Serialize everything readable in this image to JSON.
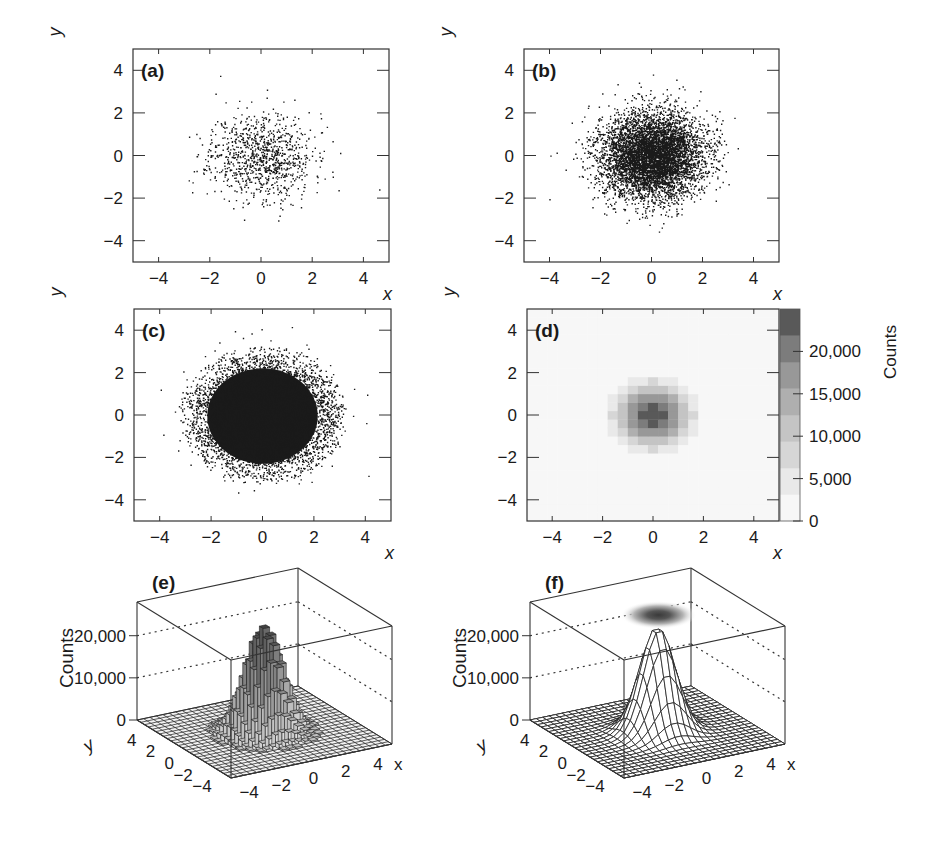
{
  "chart_data": [
    {
      "id": "a",
      "type": "scatter",
      "panel_label": "(a)",
      "title": "",
      "xlabel": "x",
      "ylabel": "y",
      "xlim": [
        -5,
        5
      ],
      "ylim": [
        -5,
        5
      ],
      "xticks": [
        -4,
        -2,
        0,
        2,
        4
      ],
      "yticks": [
        -4,
        -2,
        0,
        2,
        4
      ],
      "xtick_labels": [
        "−4",
        "−2",
        "0",
        "2",
        "4"
      ],
      "ytick_labels": [
        "−4",
        "−2",
        "0",
        "2",
        "4"
      ],
      "grid": false,
      "distribution": "2D Gaussian, mean (0,0), sigma 1",
      "approx_points": 1000,
      "marker_color": "#1a1a1a"
    },
    {
      "id": "b",
      "type": "scatter",
      "panel_label": "(b)",
      "title": "",
      "xlabel": "x",
      "ylabel": "y",
      "xlim": [
        -5,
        5
      ],
      "ylim": [
        -5,
        5
      ],
      "xticks": [
        -4,
        -2,
        0,
        2,
        4
      ],
      "yticks": [
        -4,
        -2,
        0,
        2,
        4
      ],
      "xtick_labels": [
        "−4",
        "−2",
        "0",
        "2",
        "4"
      ],
      "ytick_labels": [
        "−4",
        "−2",
        "0",
        "2",
        "4"
      ],
      "grid": false,
      "distribution": "2D Gaussian, mean (0,0), sigma 1",
      "approx_points": 10000,
      "marker_color": "#1a1a1a"
    },
    {
      "id": "c",
      "type": "scatter",
      "panel_label": "(c)",
      "title": "",
      "xlabel": "x",
      "ylabel": "y",
      "xlim": [
        -5,
        5
      ],
      "ylim": [
        -5,
        5
      ],
      "xticks": [
        -4,
        -2,
        0,
        2,
        4
      ],
      "yticks": [
        -4,
        -2,
        0,
        2,
        4
      ],
      "xtick_labels": [
        "−4",
        "−2",
        "0",
        "2",
        "4"
      ],
      "ytick_labels": [
        "−4",
        "−2",
        "0",
        "2",
        "4"
      ],
      "grid": false,
      "distribution": "2D Gaussian, mean (0,0), sigma 1",
      "approx_points": 100000,
      "marker_color": "#1a1a1a"
    },
    {
      "id": "d",
      "type": "heatmap",
      "panel_label": "(d)",
      "title": "",
      "xlabel": "x",
      "ylabel": "y",
      "xlim": [
        -5,
        5
      ],
      "ylim": [
        -5,
        5
      ],
      "xticks": [
        -4,
        -2,
        0,
        2,
        4
      ],
      "yticks": [
        -4,
        -2,
        0,
        2,
        4
      ],
      "xtick_labels": [
        "−4",
        "−2",
        "0",
        "2",
        "4"
      ],
      "ytick_labels": [
        "−4",
        "−2",
        "0",
        "2",
        "4"
      ],
      "bins": 25,
      "bin_width": 0.4,
      "peak_count": 25000,
      "colorbar": {
        "label": "Counts",
        "range": [
          0,
          25000
        ],
        "ticks": [
          0,
          5000,
          10000,
          15000,
          20000
        ],
        "tick_labels": [
          "0",
          "5,000",
          "10,000",
          "15,000",
          "20,000"
        ],
        "levels": 8,
        "colors": [
          "#f7f7f7",
          "#e9e9e9",
          "#d6d6d6",
          "#c4c4c4",
          "#afafaf",
          "#989898",
          "#7c7c7c",
          "#595959"
        ]
      }
    },
    {
      "id": "e",
      "type": "bar3d",
      "panel_label": "(e)",
      "title": "",
      "xlabel": "x",
      "ylabel": "y",
      "zlabel": "Counts",
      "xlim": [
        -5,
        5
      ],
      "ylim": [
        -5,
        5
      ],
      "zlim": [
        0,
        28000
      ],
      "xticks": [
        -4,
        -2,
        0,
        2,
        4
      ],
      "yticks": [
        -4,
        -2,
        0,
        2,
        4
      ],
      "zticks": [
        0,
        10000,
        20000
      ],
      "xtick_labels": [
        "−4",
        "−2",
        "0",
        "2",
        "4"
      ],
      "ytick_labels": [
        "−4",
        "−2",
        "0",
        "2",
        "4"
      ],
      "ztick_labels": [
        "0",
        "10,000",
        "20,000"
      ],
      "bins": 25,
      "peak_count": 25000,
      "z_gridlines": "dotted at 10,000 and 20,000"
    },
    {
      "id": "f",
      "type": "surface3d",
      "panel_label": "(f)",
      "title": "",
      "xlabel": "x",
      "ylabel": "y",
      "zlabel": "Counts",
      "xlim": [
        -5,
        5
      ],
      "ylim": [
        -5,
        5
      ],
      "zlim": [
        0,
        28000
      ],
      "xticks": [
        -4,
        -2,
        0,
        2,
        4
      ],
      "yticks": [
        -4,
        -2,
        0,
        2,
        4
      ],
      "zticks": [
        0,
        10000,
        20000
      ],
      "xtick_labels": [
        "−4",
        "−2",
        "0",
        "2",
        "4"
      ],
      "ytick_labels": [
        "−4",
        "−2",
        "0",
        "2",
        "4"
      ],
      "ztick_labels": [
        "0",
        "10,000",
        "20,000"
      ],
      "grid_lines": 25,
      "peak_count": 25000,
      "top_projection": "gray density map on top face",
      "z_gridlines": "dotted at 10,000 and 20,000"
    }
  ],
  "layout": {
    "panels2d": {
      "a": {
        "left": 133,
        "top": 49,
        "right": 389,
        "bottom": 262,
        "seed": 11
      },
      "b": {
        "left": 524,
        "top": 49,
        "right": 779,
        "bottom": 262,
        "seed": 23
      },
      "c": {
        "left": 134,
        "top": 309,
        "right": 391,
        "bottom": 521,
        "seed": 37
      },
      "d": {
        "left": 527,
        "top": 309,
        "right": 779,
        "bottom": 521
      }
    },
    "colorbar": {
      "left": 780,
      "top": 309,
      "right": 800,
      "bottom": 521
    },
    "panels3d": {
      "e": {
        "ox": 0,
        "seed": 5
      },
      "f": {
        "ox": 393
      }
    }
  }
}
